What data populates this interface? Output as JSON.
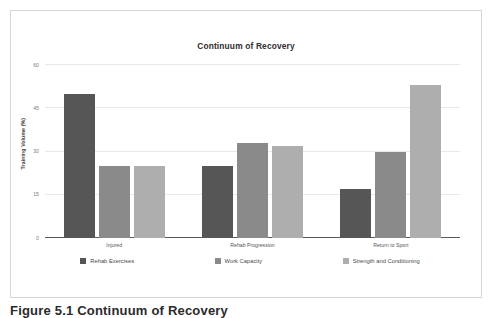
{
  "figure": {
    "caption": "Figure 5.1 Continuum of Recovery"
  },
  "colors": {
    "series_1": "#565656",
    "series_2": "#8a8a8a",
    "series_3": "#aeaeae",
    "gridline": "#e9e9e9",
    "axis": "#5a5a5a",
    "frame": "#d6d6d6"
  },
  "chart_data": {
    "type": "bar",
    "title": "Continuum of Recovery",
    "xlabel": "",
    "ylabel": "Training Volume (%)",
    "categories": [
      "Injured",
      "Rehab Progression",
      "Return to Sport"
    ],
    "series": [
      {
        "name": "Rehab Exercises",
        "color": "#565656",
        "values": [
          50,
          25,
          17
        ]
      },
      {
        "name": "Work Capacity",
        "color": "#8a8a8a",
        "values": [
          25,
          33,
          30
        ]
      },
      {
        "name": "Strength and Conditioning",
        "color": "#aeaeae",
        "values": [
          25,
          32,
          53
        ]
      }
    ],
    "ylim": [
      0,
      60
    ],
    "yticks": [
      0,
      15,
      30,
      45,
      60
    ],
    "ytick_labels": [
      "0",
      "15",
      "30",
      "45",
      "60"
    ],
    "grid": true,
    "legend_position": "bottom"
  }
}
